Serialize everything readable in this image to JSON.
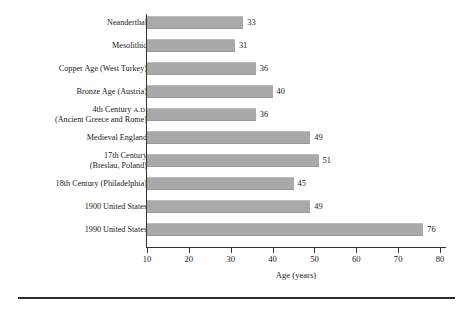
{
  "chart_data": {
    "type": "bar",
    "orientation": "horizontal",
    "title": "",
    "subtitle": "",
    "xlabel": "Age (years)",
    "ylabel": "",
    "xlim": [
      10,
      80
    ],
    "xticks": [
      10,
      20,
      30,
      40,
      50,
      60,
      70,
      80
    ],
    "xtick_labels": [
      "10",
      "20",
      "30",
      "40",
      "50",
      "60",
      "70",
      "80"
    ],
    "grid": false,
    "legend": null,
    "bar_color": "#a9a9a9",
    "axis_color": "#333333",
    "categories": [
      "Neanderthal",
      "Mesolithic",
      "Copper Age (West Turkey)",
      "Bronze Age (Austria)",
      "4th Century A.D.\n(Ancient Greece and Rome)",
      "Medieval England",
      "17th Century\n(Breslau, Poland)",
      "18th Century (Philadelphia)",
      "1900 United States",
      "1990 United States"
    ],
    "values": [
      33,
      31,
      36,
      40,
      36,
      49,
      51,
      45,
      49,
      76
    ],
    "value_labels": [
      "33",
      "31",
      "36",
      "40",
      "36",
      "49",
      "51",
      "45",
      "49",
      "76"
    ],
    "bars": [
      {
        "category": "Neanderthal",
        "category_line1": "Neanderthal",
        "category_line2": "",
        "value": 33,
        "label": "33"
      },
      {
        "category": "Mesolithic",
        "category_line1": "Mesolithic",
        "category_line2": "",
        "value": 31,
        "label": "31"
      },
      {
        "category": "Copper Age (West Turkey)",
        "category_line1": "Copper Age (West Turkey)",
        "category_line2": "",
        "value": 36,
        "label": "36"
      },
      {
        "category": "Bronze Age (Austria)",
        "category_line1": "Bronze Age (Austria)",
        "category_line2": "",
        "value": 40,
        "label": "40"
      },
      {
        "category": "4th Century A.D. (Ancient Greece and Rome)",
        "category_line1": "4th Century A.D.",
        "category_line2": "(Ancient Greece and Rome)",
        "value": 36,
        "label": "36"
      },
      {
        "category": "Medieval England",
        "category_line1": "Medieval England",
        "category_line2": "",
        "value": 49,
        "label": "49"
      },
      {
        "category": "17th Century (Breslau, Poland)",
        "category_line1": "17th Century",
        "category_line2": "(Breslau, Poland)",
        "value": 51,
        "label": "51"
      },
      {
        "category": "18th Century (Philadelphia)",
        "category_line1": "18th Century (Philadelphia)",
        "category_line2": "",
        "value": 45,
        "label": "45"
      },
      {
        "category": "1900 United States",
        "category_line1": "1900 United States",
        "category_line2": "",
        "value": 49,
        "label": "49"
      },
      {
        "category": "1990 United States",
        "category_line1": "1990 United States",
        "category_line2": "",
        "value": 76,
        "label": "76"
      }
    ]
  }
}
